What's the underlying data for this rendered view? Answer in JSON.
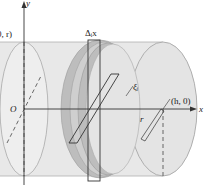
{
  "diagram": {
    "type": "cylinder-cross-section",
    "labels": {
      "y_axis": "y",
      "x_axis": "x",
      "origin": "O",
      "top_left_point": "(0, r)",
      "slice_width": "Δᵢx",
      "sample_point": "ξᵢ",
      "right_point": "(h, 0)",
      "radius": "r"
    },
    "colors": {
      "cylinder_fill": "#e6e6e6",
      "cylinder_edge": "#9a9a9a",
      "disk_fill": "#bdbdbd",
      "disk_inner": "#d2d2d2",
      "axis": "#333333"
    }
  }
}
